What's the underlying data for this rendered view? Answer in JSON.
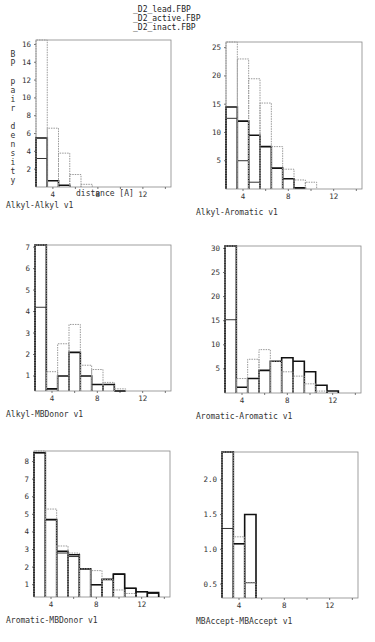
{
  "legend": {
    "items": [
      {
        "label": "D2_lead.FBP",
        "style": "solid-thin"
      },
      {
        "label": "D2_active.FBP",
        "style": "solid-thick"
      },
      {
        "label": "D2_inact.FBP",
        "style": "dotted"
      }
    ]
  },
  "ylabel": "BP pair density",
  "xlabel": "distance [A]",
  "colors": {
    "lead": "#333333",
    "active": "#111111",
    "inact": "#999999",
    "frame": "#888888"
  },
  "chart_data": [
    {
      "type": "bar",
      "title": "Alkyl-Alkyl v1",
      "xlabel": "distance [A]",
      "ylabel": "BP pair density",
      "xlim": [
        2.5,
        14.5
      ],
      "ylim": [
        0,
        16.5
      ],
      "xticks": [
        4,
        8,
        12
      ],
      "yticks": [
        2,
        4,
        6,
        8,
        10,
        12,
        14,
        16
      ],
      "bins": [
        3,
        4,
        5,
        6,
        7,
        8,
        9,
        10,
        11,
        12,
        13,
        14
      ],
      "series": [
        {
          "name": "D2_lead.FBP",
          "values": [
            3.2,
            0,
            0,
            0,
            0,
            0,
            0,
            0,
            0,
            0,
            0,
            0
          ]
        },
        {
          "name": "D2_active.FBP",
          "values": [
            5.5,
            0.7,
            0.2,
            0,
            0,
            0,
            0,
            0,
            0,
            0,
            0,
            0
          ]
        },
        {
          "name": "D2_inact.FBP",
          "values": [
            16.5,
            6.6,
            3.8,
            1.4,
            0.3,
            0,
            0,
            0,
            0,
            0,
            0,
            0
          ]
        }
      ],
      "frame": {
        "x": 36,
        "y": 40,
        "w": 135,
        "h": 147
      }
    },
    {
      "type": "bar",
      "title": "Alkyl-Aromatic v1",
      "xlabel": "",
      "ylabel": "",
      "xlim": [
        2.5,
        14.5
      ],
      "ylim": [
        0,
        26
      ],
      "xticks": [
        4,
        8,
        12
      ],
      "yticks": [
        5,
        10,
        15,
        20,
        25
      ],
      "bins": [
        3,
        4,
        5,
        6,
        7,
        8,
        9,
        10,
        11,
        12,
        13,
        14
      ],
      "series": [
        {
          "name": "D2_lead.FBP",
          "values": [
            12.5,
            5,
            1.2,
            0,
            0,
            0,
            0,
            0,
            0,
            0,
            0,
            0
          ]
        },
        {
          "name": "D2_active.FBP",
          "values": [
            14.5,
            12,
            9.5,
            7.5,
            3.7,
            1.8,
            0.2,
            0,
            0,
            0,
            0,
            0
          ]
        },
        {
          "name": "D2_inact.FBP",
          "values": [
            26,
            23,
            19.5,
            15.2,
            7.5,
            3.5,
            1.6,
            1.2,
            0,
            0,
            0,
            0
          ]
        }
      ],
      "frame": {
        "x": 226,
        "y": 42,
        "w": 136,
        "h": 147
      }
    },
    {
      "type": "bar",
      "title": "Alkyl-MBDonor v1",
      "xlabel": "",
      "ylabel": "",
      "xlim": [
        2.5,
        14.5
      ],
      "ylim": [
        0.3,
        7.1
      ],
      "xticks": [
        4,
        8,
        12
      ],
      "yticks": [
        1,
        2,
        3,
        4,
        5,
        6,
        7
      ],
      "bins": [
        3,
        4,
        5,
        6,
        7,
        8,
        9,
        10,
        11,
        12,
        13,
        14
      ],
      "series": [
        {
          "name": "D2_lead.FBP",
          "values": [
            4.2,
            0,
            0,
            0,
            0,
            0,
            0,
            0,
            0,
            0,
            0,
            0
          ]
        },
        {
          "name": "D2_active.FBP",
          "values": [
            7.1,
            0.4,
            1.0,
            2.1,
            1.0,
            0.6,
            0.6,
            0.3,
            0,
            0,
            0,
            0
          ]
        },
        {
          "name": "D2_inact.FBP",
          "values": [
            7.1,
            1.2,
            2.5,
            3.4,
            1.5,
            1.3,
            0.7,
            0.4,
            0,
            0,
            0,
            0
          ]
        }
      ],
      "frame": {
        "x": 35,
        "y": 245,
        "w": 136,
        "h": 146
      }
    },
    {
      "type": "bar",
      "title": "Aromatic-Aromatic v1",
      "xlabel": "",
      "ylabel": "",
      "xlim": [
        2.5,
        14.5
      ],
      "ylim": [
        0,
        30.5
      ],
      "xticks": [
        4,
        8,
        12
      ],
      "yticks": [
        5,
        10,
        15,
        20,
        25,
        30
      ],
      "bins": [
        3,
        4,
        5,
        6,
        7,
        8,
        9,
        10,
        11,
        12,
        13,
        14
      ],
      "series": [
        {
          "name": "D2_lead.FBP",
          "values": [
            15.2,
            0,
            0,
            0,
            0,
            0,
            0,
            0,
            0,
            0,
            0,
            0
          ]
        },
        {
          "name": "D2_active.FBP",
          "values": [
            30.5,
            1.2,
            3.0,
            4.7,
            6.6,
            7.3,
            6.6,
            4.4,
            1.6,
            0.4,
            0,
            0
          ]
        },
        {
          "name": "D2_inact.FBP",
          "values": [
            30.5,
            3.0,
            7.0,
            9.0,
            6.6,
            4.4,
            3.5,
            1.9,
            0.4,
            0,
            0,
            0
          ]
        }
      ],
      "frame": {
        "x": 225,
        "y": 246,
        "w": 136,
        "h": 147
      }
    },
    {
      "type": "bar",
      "title": "Aromatic-MBDonor v1",
      "xlabel": "",
      "ylabel": "",
      "xlim": [
        2.5,
        14.5
      ],
      "ylim": [
        0.3,
        8.6
      ],
      "xticks": [
        4,
        8,
        12
      ],
      "yticks": [
        1,
        2,
        3,
        4,
        5,
        6,
        7,
        8
      ],
      "bins": [
        3,
        4,
        5,
        6,
        7,
        8,
        9,
        10,
        11,
        12,
        13,
        14
      ],
      "series": [
        {
          "name": "D2_lead.FBP",
          "values": [
            8.5,
            4.7,
            2.8,
            2.6,
            1.9,
            1.0,
            1.3,
            1.6,
            0.8,
            0.6,
            0.5,
            0
          ]
        },
        {
          "name": "D2_active.FBP",
          "values": [
            8.5,
            4.7,
            2.9,
            2.7,
            1.9,
            1.0,
            1.3,
            1.6,
            0.8,
            0.6,
            0.55,
            0
          ]
        },
        {
          "name": "D2_inact.FBP",
          "values": [
            8.6,
            5.3,
            3.2,
            2.8,
            1.9,
            1.8,
            1.3,
            0.7,
            0.5,
            0,
            0,
            0
          ]
        }
      ],
      "frame": {
        "x": 34,
        "y": 451,
        "w": 136,
        "h": 146
      }
    },
    {
      "type": "bar",
      "title": "MBAccept-MBAccept v1",
      "xlabel": "",
      "ylabel": "",
      "xlim": [
        2.5,
        14.5
      ],
      "ylim": [
        0.3,
        2.4
      ],
      "xticks": [
        4,
        8,
        12
      ],
      "yticks": [
        0.5,
        1.0,
        1.5,
        2.0
      ],
      "bins": [
        3,
        4,
        5,
        6,
        7,
        8,
        9,
        10,
        11,
        12,
        13,
        14
      ],
      "series": [
        {
          "name": "D2_lead.FBP",
          "values": [
            1.3,
            1.08,
            0.52,
            0,
            0,
            0,
            0,
            0,
            0,
            0,
            0,
            0
          ]
        },
        {
          "name": "D2_active.FBP",
          "values": [
            2.4,
            1.08,
            1.5,
            0,
            0,
            0,
            0,
            0,
            0,
            0,
            0,
            0
          ]
        },
        {
          "name": "D2_inact.FBP",
          "values": [
            2.4,
            1.18,
            0.52,
            0,
            0,
            0,
            0,
            0,
            0,
            0,
            0,
            0
          ]
        }
      ],
      "frame": {
        "x": 222,
        "y": 452,
        "w": 136,
        "h": 146
      }
    }
  ]
}
